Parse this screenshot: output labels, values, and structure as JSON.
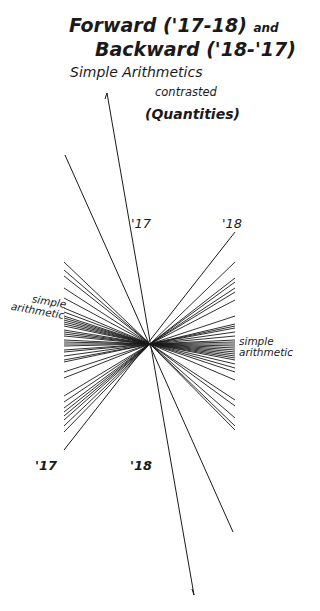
{
  "header_strip": "",
  "title": {
    "line1": "Forward ('17-18)",
    "line1_suffix": "and",
    "line2": "Backward ('18-'17)",
    "line3": "Simple Arithmetics",
    "line4": "contrasted",
    "line5": "(Quantities)"
  },
  "labels": {
    "top_left_year": "'17",
    "top_right_year": "'18",
    "bottom_left_year": "'17",
    "bottom_mid_year": "'18",
    "left_axis_line1": "simple",
    "left_axis_line2": "arithmetic",
    "right_axis_line1": "simple",
    "right_axis_line2": "arithmetic"
  },
  "colors": {
    "ink": "#1a1a1a",
    "background": "#ffffff"
  },
  "diagram": {
    "center": [
      150,
      344
    ],
    "left_endpoints_y": [
      262,
      270,
      276,
      288,
      298,
      308,
      312,
      316,
      318,
      320,
      322,
      324,
      326,
      330,
      332,
      334,
      336,
      340,
      342,
      344,
      346,
      350,
      352,
      356,
      360,
      362,
      372,
      378,
      396,
      402,
      408,
      412,
      416,
      420,
      426,
      432
    ],
    "right_endpoints_y": [
      262,
      278,
      282,
      288,
      292,
      300,
      316,
      324,
      326,
      328,
      332,
      336,
      340,
      342,
      344,
      346,
      348,
      350,
      352,
      354,
      356,
      358,
      360,
      364,
      368,
      372,
      380,
      400,
      406,
      418,
      426,
      430
    ],
    "left_x": 64,
    "right_x": 235,
    "long_lines": [
      {
        "from": [
          107,
          93
        ],
        "to": [
          194,
          595
        ]
      },
      {
        "from": [
          65,
          155
        ],
        "to": [
          233,
          532
        ]
      },
      {
        "from": [
          235,
          232
        ],
        "to": [
          64,
          450
        ]
      }
    ]
  }
}
